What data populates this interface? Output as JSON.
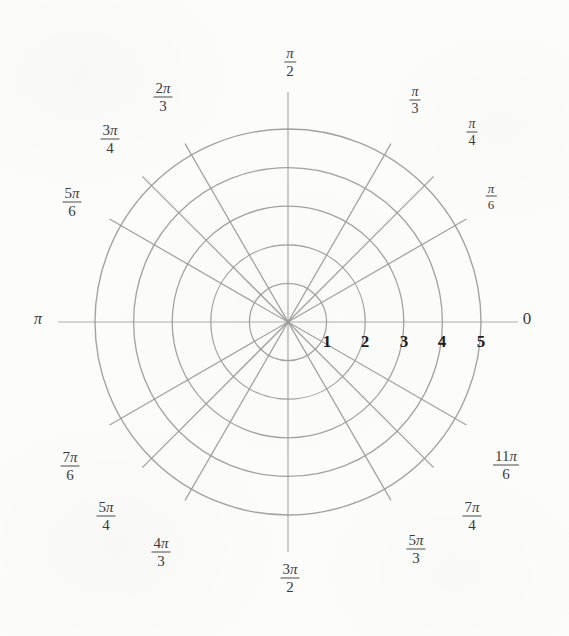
{
  "figure": {
    "type": "polar-grid",
    "background_color": "#fcfcfb",
    "line_color": "#9a9a9a",
    "text_color": "#3b3b3b",
    "radial_label_color": "#1d1d1d"
  },
  "chart_data": {
    "type": "polar-grid",
    "title": "",
    "xlabel": "",
    "ylabel": "",
    "grid": true,
    "legend": "none",
    "center_px": {
      "x": 288,
      "y": 322
    },
    "unit_radius_px": 38.6,
    "radial_ticks": [
      1,
      2,
      3,
      4,
      5
    ],
    "radial_tick_labels": [
      "1",
      "2",
      "3",
      "4",
      "5"
    ],
    "rlim": [
      0,
      5
    ],
    "angular_ticks_deg": [
      0,
      30,
      45,
      60,
      90,
      120,
      135,
      150,
      180,
      210,
      225,
      240,
      270,
      300,
      315,
      330
    ],
    "angular_tick_labels": [
      "0",
      "π/6",
      "π/4",
      "π/3",
      "π/2",
      "2π/3",
      "3π/4",
      "5π/6",
      "π",
      "7π/6",
      "5π/4",
      "4π/3",
      "3π/2",
      "5π/3",
      "7π/4",
      "11π/6"
    ],
    "num_circles": 5,
    "num_spokes": 12,
    "series": []
  },
  "radial_labels": [
    {
      "text": "1",
      "x": 327,
      "y": 341,
      "size": 17
    },
    {
      "text": "2",
      "x": 365,
      "y": 341,
      "size": 17
    },
    {
      "text": "3",
      "x": 404,
      "y": 341,
      "size": 17
    },
    {
      "text": "4",
      "x": 442,
      "y": 341,
      "size": 17
    },
    {
      "text": "5",
      "x": 481,
      "y": 341,
      "size": 17
    }
  ],
  "angle_labels": [
    {
      "name": "zero",
      "kind": "plain",
      "text": "0",
      "x": 527,
      "y": 318,
      "size": 17
    },
    {
      "name": "pi",
      "kind": "plain",
      "text": "π",
      "x": 38,
      "y": 319,
      "size": 16
    },
    {
      "name": "pi-over-6",
      "kind": "frac",
      "num": "π",
      "den": "6",
      "x": 491,
      "y": 196,
      "size": 13
    },
    {
      "name": "pi-over-4",
      "kind": "frac",
      "num": "π",
      "den": "4",
      "x": 472,
      "y": 132,
      "size": 14
    },
    {
      "name": "pi-over-3",
      "kind": "frac",
      "num": "π",
      "den": "3",
      "x": 415,
      "y": 100,
      "size": 14
    },
    {
      "name": "pi-over-2",
      "kind": "frac",
      "num": "π",
      "den": "2",
      "x": 290,
      "y": 62,
      "size": 15
    },
    {
      "name": "two-pi-over-3",
      "kind": "frac",
      "num": "2π",
      "den": "3",
      "x": 163,
      "y": 97,
      "size": 15
    },
    {
      "name": "three-pi-over-4",
      "kind": "frac",
      "num": "3π",
      "den": "4",
      "x": 110,
      "y": 139,
      "size": 15
    },
    {
      "name": "five-pi-over-6",
      "kind": "frac",
      "num": "5π",
      "den": "6",
      "x": 72,
      "y": 202,
      "size": 15
    },
    {
      "name": "seven-pi-over-6",
      "kind": "frac",
      "num": "7π",
      "den": "6",
      "x": 70,
      "y": 466,
      "size": 15
    },
    {
      "name": "five-pi-over-4",
      "kind": "frac",
      "num": "5π",
      "den": "4",
      "x": 106,
      "y": 516,
      "size": 15
    },
    {
      "name": "four-pi-over-3",
      "kind": "frac",
      "num": "4π",
      "den": "3",
      "x": 161,
      "y": 552,
      "size": 15
    },
    {
      "name": "three-pi-over-2",
      "kind": "frac",
      "num": "3π",
      "den": "2",
      "x": 290,
      "y": 578,
      "size": 15
    },
    {
      "name": "five-pi-over-3",
      "kind": "frac",
      "num": "5π",
      "den": "3",
      "x": 416,
      "y": 549,
      "size": 15
    },
    {
      "name": "seven-pi-over-4",
      "kind": "frac",
      "num": "7π",
      "den": "4",
      "x": 472,
      "y": 516,
      "size": 15
    },
    {
      "name": "eleven-pi-over-6",
      "kind": "frac",
      "num": "11π",
      "den": "6",
      "x": 506,
      "y": 465,
      "size": 15
    }
  ]
}
